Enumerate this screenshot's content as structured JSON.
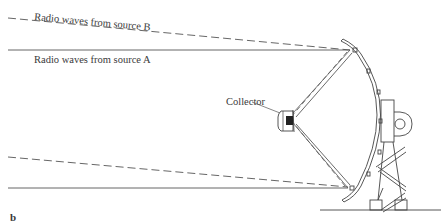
{
  "figure": {
    "panel_label": "b",
    "labels": {
      "source_b": "Radio waves from source B",
      "source_a": "Radio waves from source A",
      "collector": "Collector"
    },
    "colors": {
      "line": "#4a4a4a",
      "background": "#ffffff",
      "collector_fill": "#222222"
    },
    "legend": {
      "solid_line": "source A",
      "dashed_line": "source B"
    }
  }
}
